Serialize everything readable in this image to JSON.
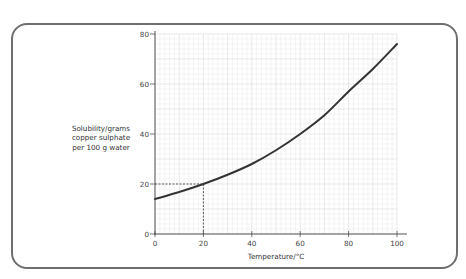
{
  "chart_data": {
    "type": "line",
    "title": "",
    "xlabel": "Temperature/°C",
    "ylabel": "Solubility/grams\ncopper sulphate\nper 100 g water",
    "xlim": [
      0,
      100
    ],
    "ylim": [
      0,
      80
    ],
    "x_ticks": [
      0,
      20,
      40,
      60,
      80,
      100
    ],
    "y_ticks": [
      0,
      20,
      40,
      60,
      80
    ],
    "x_tick_labels": [
      "0",
      "20",
      "40",
      "60",
      "80",
      "100"
    ],
    "y_tick_labels": [
      "0",
      "20",
      "40",
      "60",
      "80"
    ],
    "grid": true,
    "grid_minor_step": 2,
    "grid_major_step": 10,
    "series": [
      {
        "name": "copper sulphate solubility",
        "x": [
          0,
          10,
          20,
          30,
          40,
          50,
          60,
          70,
          80,
          90,
          100
        ],
        "y": [
          14,
          16.8,
          20,
          23.7,
          28,
          33.5,
          40,
          47.5,
          57,
          66,
          76
        ],
        "color": "#333333"
      }
    ],
    "annotations": [
      {
        "type": "dashed-guide",
        "x": 20,
        "y": 20,
        "description": "reading at 20°C gives 20 g"
      }
    ]
  },
  "colors": {
    "frame": "#6f6f6f",
    "curve": "#333333",
    "grid_minor": "#ececec",
    "grid_major": "#d8d8d8",
    "axis": "#555555"
  }
}
